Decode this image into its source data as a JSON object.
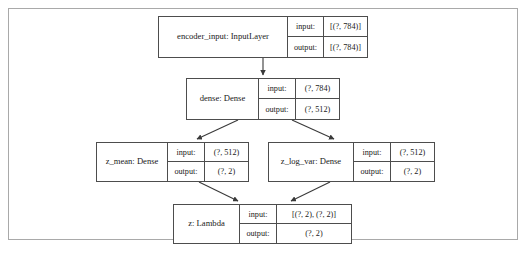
{
  "figure": {
    "kind": "keras-model-graph",
    "frame_color": "#a9a9a9",
    "node_border_color": "#4d4d4d",
    "background": "#ffffff"
  },
  "io_labels": {
    "input": "input:",
    "output": "output:"
  },
  "nodes": [
    {
      "id": "encoder_input",
      "name": "encoder_input: InputLayer",
      "input": "[(?, 784)]",
      "output": "[(?, 784)]"
    },
    {
      "id": "dense",
      "name": "dense: Dense",
      "input": "(?, 784)",
      "output": "(?, 512)"
    },
    {
      "id": "z_mean",
      "name": "z_mean: Dense",
      "input": "(?, 512)",
      "output": "(?, 2)"
    },
    {
      "id": "z_log_var",
      "name": "z_log_var: Dense",
      "input": "(?, 512)",
      "output": "(?, 2)"
    },
    {
      "id": "z",
      "name": "z: Lambda",
      "input": "[(?, 2), (?, 2)]",
      "output": "(?, 2)"
    }
  ],
  "edges": [
    {
      "from": "encoder_input",
      "to": "dense"
    },
    {
      "from": "dense",
      "to": "z_mean"
    },
    {
      "from": "dense",
      "to": "z_log_var"
    },
    {
      "from": "z_mean",
      "to": "z"
    },
    {
      "from": "z_log_var",
      "to": "z"
    }
  ]
}
